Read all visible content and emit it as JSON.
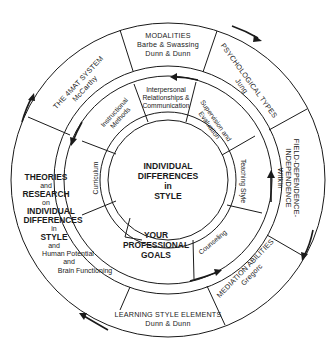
{
  "diagram": {
    "title": "Individual Differences in Style",
    "center": {
      "lines": [
        "INDIVIDUAL",
        "DIFFERENCES",
        "in",
        "STYLE"
      ]
    },
    "goals": {
      "lines": [
        "YOUR",
        "PROFESSIONAL",
        "GOALS"
      ]
    },
    "outer_ring": [
      {
        "id": "modalities",
        "lines": [
          "MODALITIES",
          "Barbe & Swassing",
          "Dunn & Dunn"
        ]
      },
      {
        "id": "psychological-types",
        "lines": [
          "PSYCHOLOGICAL TYPES",
          "Jung"
        ]
      },
      {
        "id": "field-dependence",
        "lines": [
          "FIELD-DEPENDENCE-",
          "INDEPENDENCE",
          "Witkin"
        ]
      },
      {
        "id": "mediation-abilities",
        "lines": [
          "MEDIATION ABILITIES",
          "Gregorc"
        ]
      },
      {
        "id": "learning-style-elements",
        "lines": [
          "LEARNING STYLE ELEMENTS",
          "Dunn & Dunn"
        ]
      },
      {
        "id": "4mat-system",
        "lines": [
          "THE 4MAT SYSTEM",
          "McCarthy"
        ]
      }
    ],
    "theories": {
      "lines": [
        {
          "text": "THEORIES",
          "bold": true
        },
        {
          "text": "and",
          "bold": false
        },
        {
          "text": "RESEARCH",
          "bold": true
        },
        {
          "text": "on",
          "bold": false
        },
        {
          "text": "INDIVIDUAL",
          "bold": true
        },
        {
          "text": "DIFFERENCES",
          "bold": true
        },
        {
          "text": "in",
          "bold": false
        },
        {
          "text": "STYLE",
          "bold": true
        },
        {
          "text": "and",
          "bold": false
        },
        {
          "text": "Human Potential",
          "bold": false
        },
        {
          "text": "and",
          "bold": false
        },
        {
          "text": "Brain Functioning",
          "bold": false
        }
      ]
    },
    "inner_ring": [
      {
        "id": "interpersonal",
        "lines": [
          "Interpersonal",
          "Relationships &",
          "Communication"
        ]
      },
      {
        "id": "supervision",
        "lines": [
          "Supervision and",
          "Evaluation"
        ]
      },
      {
        "id": "teaching-style",
        "lines": [
          "Teaching Style"
        ]
      },
      {
        "id": "counseling",
        "lines": [
          "Counseling"
        ]
      },
      {
        "id": "curriculum",
        "lines": [
          "Curriculum"
        ]
      },
      {
        "id": "instructional-methods",
        "lines": [
          "Instructional",
          "Methods"
        ]
      }
    ],
    "colors": {
      "line": "#1a1a1a",
      "background": "#ffffff"
    }
  }
}
